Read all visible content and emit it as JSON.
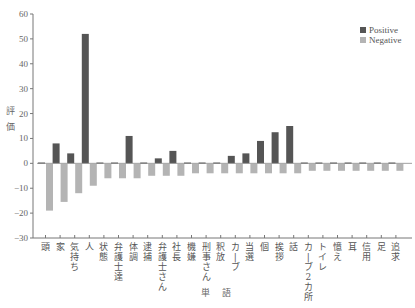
{
  "chart_data": {
    "type": "bar",
    "title": "",
    "xlabel": "単語",
    "ylabel": "評価",
    "ylim": [
      -30,
      60
    ],
    "yticks": [
      60,
      50,
      40,
      30,
      20,
      10,
      0,
      -10,
      -20,
      -30
    ],
    "grid": false,
    "legend_position": "top-right",
    "categories": [
      "頭",
      "家",
      "気持ち",
      "人",
      "状態",
      "弁護士達",
      "体調",
      "逮捕",
      "弁護士さん",
      "社長",
      "機嫌",
      "刑事さん",
      "釈放",
      "カーブ",
      "当選",
      "個",
      "挨拶",
      "話",
      "カーブ2カ所",
      "トイレ",
      "憶え",
      "耳",
      "信用",
      "足",
      "追求"
    ],
    "series": [
      {
        "name": "Positive",
        "color": "#555555",
        "values": [
          0,
          8,
          4,
          52,
          0,
          0,
          11,
          0,
          2,
          5,
          0,
          0,
          0,
          3,
          4,
          9,
          12.5,
          15,
          0,
          0,
          0,
          0,
          0,
          0,
          0
        ]
      },
      {
        "name": "Negative",
        "color": "#b4b4b4",
        "values": [
          -19,
          -15.5,
          -12,
          -9,
          -6,
          -6,
          -6,
          -5,
          -5,
          -5,
          -4,
          -4,
          -4,
          -4,
          -4,
          -4,
          -4,
          -4,
          -3,
          -3,
          -3,
          -3,
          -3,
          -3,
          -3
        ]
      }
    ]
  }
}
